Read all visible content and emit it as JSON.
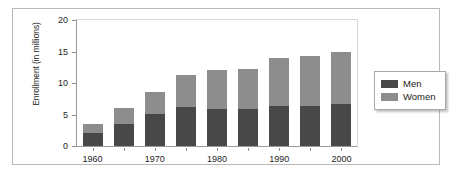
{
  "chart_data": {
    "type": "bar",
    "stacked": true,
    "title": "",
    "xlabel": "",
    "ylabel": "Enrollment (in millions)",
    "ylim": [
      0,
      20
    ],
    "yticks": [
      0,
      5,
      10,
      15,
      20
    ],
    "grid": false,
    "legend_position": "right",
    "categories": [
      "1960",
      "1965",
      "1970",
      "1975",
      "1980",
      "1985",
      "1990",
      "1995",
      "2000"
    ],
    "tick_labels": [
      "1960",
      "",
      "1970",
      "",
      "1980",
      "",
      "1990",
      "",
      "2000"
    ],
    "series": [
      {
        "name": "Men",
        "color": "#484848",
        "values": [
          2.0,
          3.5,
          5.1,
          6.2,
          5.8,
          5.9,
          6.4,
          6.4,
          6.6
        ]
      },
      {
        "name": "Women",
        "color": "#8d8d8d",
        "values": [
          1.5,
          2.5,
          3.4,
          5.0,
          6.3,
          6.4,
          7.6,
          7.9,
          8.4
        ]
      }
    ],
    "totals": [
      3.5,
      6.0,
      8.5,
      11.2,
      12.1,
      12.3,
      14.0,
      14.3,
      15.0
    ]
  },
  "legend": {
    "entries": [
      {
        "label": "Men",
        "color": "#484848"
      },
      {
        "label": "Women",
        "color": "#8d8d8d"
      }
    ]
  }
}
